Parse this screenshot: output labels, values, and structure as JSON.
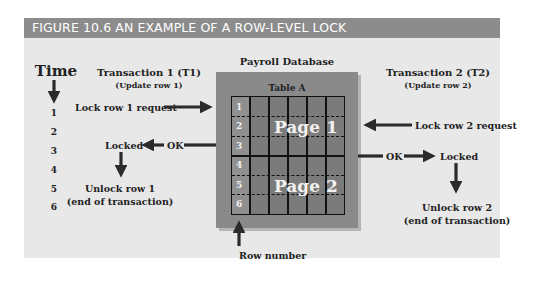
{
  "figure": {
    "title": "FIGURE 10.6  AN EXAMPLE OF A ROW-LEVEL LOCK",
    "header_color": "#8c8c8c",
    "panel_color": "#e8e8e8"
  },
  "time": {
    "label": "Time",
    "ticks": [
      "1",
      "2",
      "3",
      "4",
      "5",
      "6"
    ]
  },
  "t1": {
    "title": "Transaction 1 (T1)",
    "subtitle": "(Update row 1)",
    "request": "Lock row 1 request",
    "ok": "OK",
    "locked": "Locked",
    "unlock_line1": "Unlock row 1",
    "unlock_line2": "(end of transaction)"
  },
  "t2": {
    "title": "Transaction 2 (T2)",
    "subtitle": "(Update row 2)",
    "request": "Lock row 2 request",
    "ok": "OK",
    "locked": "Locked",
    "unlock_line1": "Unlock row 2",
    "unlock_line2": "(end of transaction)"
  },
  "database": {
    "name": "Payroll Database",
    "table": "Table A",
    "pages": [
      "Page 1",
      "Page 2"
    ],
    "rows": [
      "1",
      "2",
      "3",
      "4",
      "5",
      "6"
    ],
    "row_number_label": "Row number"
  }
}
